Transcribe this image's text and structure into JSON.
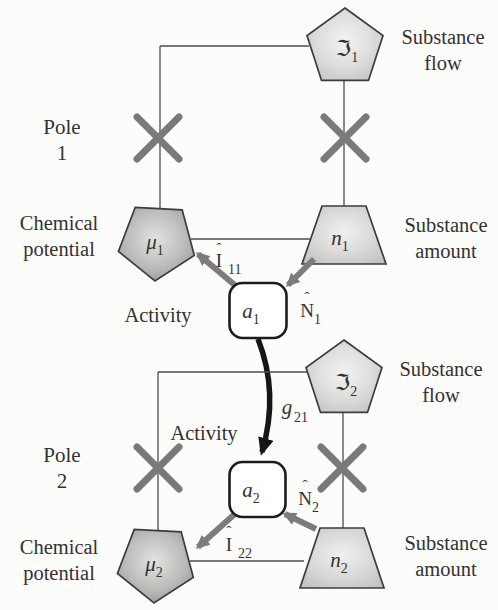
{
  "colors": {
    "background": "#fcfcfb",
    "frame_line": "#4d4d4d",
    "cross_mark": "#7a7a7a",
    "gray_arrow": "#7c7c7c",
    "black_arrow": "#161616",
    "text": "#333231",
    "shape_border": "#3c3c3c",
    "light_shape_center": "#f2f2f1",
    "light_shape_edge": "#c3c3c3",
    "dark_shape_center": "#dedede",
    "dark_shape_edge": "#949494"
  },
  "pole1": {
    "label_line1": "Pole",
    "label_line2": "1",
    "substance_flow": {
      "line1": "Substance",
      "line2": "flow",
      "symbol": "ℑ",
      "sub": "1"
    },
    "chemical_potential": {
      "line1": "Chemical",
      "line2": "potential",
      "symbol": "μ",
      "sub": "1"
    },
    "substance_amount": {
      "line1": "Substance",
      "line2": "amount",
      "symbol": "n",
      "sub": "1"
    },
    "activity": {
      "label": "Activity",
      "symbol": "a",
      "sub": "1"
    },
    "flow_operator": {
      "hat": "ˆ",
      "base": "I",
      "sub": "11"
    },
    "amount_operator": {
      "hat": "ˆ",
      "base": "N",
      "sub": "1"
    }
  },
  "pole2": {
    "label_line1": "Pole",
    "label_line2": "2",
    "substance_flow": {
      "line1": "Substance",
      "line2": "flow",
      "symbol": "ℑ",
      "sub": "2"
    },
    "chemical_potential": {
      "line1": "Chemical",
      "line2": "potential",
      "symbol": "μ",
      "sub": "2"
    },
    "substance_amount": {
      "line1": "Substance",
      "line2": "amount",
      "symbol": "n",
      "sub": "2"
    },
    "activity": {
      "label": "Activity",
      "symbol": "a",
      "sub": "2"
    },
    "flow_operator": {
      "hat": "ˆ",
      "base": "I",
      "sub": "22"
    },
    "amount_operator": {
      "hat": "ˆ",
      "base": "N",
      "sub": "2"
    }
  },
  "coupling": {
    "base": "g",
    "sub": "21"
  }
}
